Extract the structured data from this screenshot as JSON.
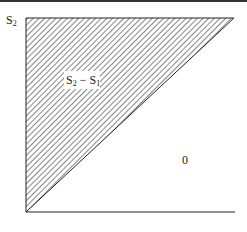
{
  "diagram": {
    "axis_label_y": {
      "base": "S",
      "sub": "2"
    },
    "region_upper": {
      "left": {
        "base": "S",
        "sub": "2"
      },
      "op": " − ",
      "right": {
        "base": "S",
        "sub": "1"
      }
    },
    "region_lower": "0",
    "colors": {
      "line": "#222222",
      "hatch": "#333333",
      "background": "#ffffff",
      "topbar": "#333333"
    }
  }
}
